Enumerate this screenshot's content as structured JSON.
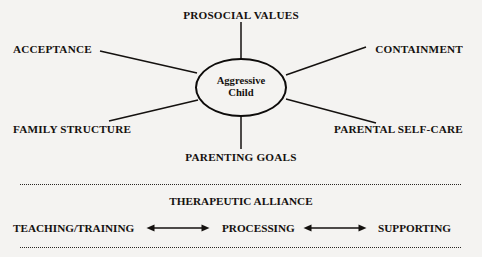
{
  "diagram": {
    "hub": {
      "line1": "Aggressive",
      "line2": "Child"
    },
    "spoke_labels": {
      "top": "PROSOCIAL VALUES",
      "upper_left": "ACCEPTANCE",
      "upper_right": "CONTAINMENT",
      "lower_left": "FAMILY STRUCTURE",
      "lower_right": "PARENTAL SELF-CARE",
      "bottom": "PARENTING GOALS"
    },
    "alliance": {
      "title": "THERAPEUTIC ALLIANCE",
      "terms": {
        "left": "TEACHING/TRAINING",
        "center": "PROCESSING",
        "right": "SUPPORTING"
      },
      "connector_left": "double-headed-arrow",
      "connector_right": "double-headed-arrow"
    },
    "colors": {
      "background": "#f4f3f1",
      "ink": "#14110f",
      "stroke": "#0d0b0a"
    }
  }
}
